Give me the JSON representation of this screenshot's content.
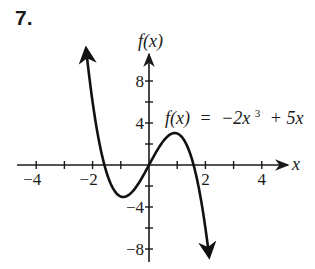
{
  "problem": {
    "number": "7."
  },
  "chart_data": {
    "type": "line",
    "title": "",
    "function": "f(x) = -2x^3 + 5x",
    "equation_label": {
      "fx": "f(x)",
      "eq": "=",
      "rhs_a": "−2x",
      "rhs_exp": "3",
      "rhs_b": "+ 5x"
    },
    "xlabel": "x",
    "ylabel": "f(x)",
    "xlim": [
      -4.5,
      5.0
    ],
    "ylim": [
      -9.0,
      10.5
    ],
    "x_ticks": [
      -4,
      -3,
      -2,
      -1,
      0,
      1,
      2,
      3,
      4
    ],
    "x_tick_labels": [
      {
        "value": -4,
        "label": "−4"
      },
      {
        "value": -2,
        "label": "−2"
      },
      {
        "value": 2,
        "label": "2"
      },
      {
        "value": 4,
        "label": "4"
      }
    ],
    "y_ticks": [
      -8,
      -6,
      -4,
      -2,
      0,
      2,
      4,
      6,
      8
    ],
    "y_tick_labels": [
      {
        "value": 8,
        "label": "8"
      },
      {
        "value": 4,
        "label": "4"
      },
      {
        "value": -4,
        "label": "−4"
      },
      {
        "value": -8,
        "label": "−8"
      }
    ],
    "curve": {
      "x_start": -2.23,
      "x_end": 2.13,
      "arrows": "both"
    },
    "key_points": [
      {
        "name": "local_min",
        "x": -0.91,
        "y": -3.04
      },
      {
        "name": "origin",
        "x": 0,
        "y": 0
      },
      {
        "name": "local_max",
        "x": 0.91,
        "y": 3.04
      },
      {
        "name": "root_left",
        "x": -1.58,
        "y": 0
      },
      {
        "name": "root_right",
        "x": 1.58,
        "y": 0
      }
    ],
    "grid": false,
    "legend": null,
    "colors": {
      "axis": "#1a1a1a",
      "curve": "#111111"
    }
  }
}
